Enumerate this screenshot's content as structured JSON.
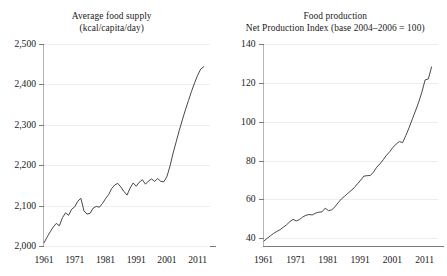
{
  "chart_data": [
    {
      "type": "line",
      "panel": "left",
      "title": "Average food supply",
      "subtitle": "(kcal/capita/day)",
      "xlabel": "",
      "ylabel": "",
      "xlim": [
        1961,
        2015
      ],
      "ylim": [
        2000,
        2500
      ],
      "yticks": [
        2000,
        2100,
        2200,
        2300,
        2400,
        2500
      ],
      "ytick_labels": [
        "2,000",
        "2,100",
        "2,200",
        "2,300",
        "2,400",
        "2,500"
      ],
      "xticks": [
        1961,
        1971,
        1981,
        1991,
        2001,
        2011
      ],
      "xtick_labels": [
        "1961",
        "1971",
        "1981",
        "1991",
        "2001",
        "2011"
      ],
      "grid": true,
      "legend": "none",
      "series": [
        {
          "name": "Average food supply",
          "x": [
            1961,
            1962,
            1963,
            1964,
            1965,
            1966,
            1967,
            1968,
            1969,
            1970,
            1971,
            1972,
            1973,
            1974,
            1975,
            1976,
            1977,
            1978,
            1979,
            1980,
            1981,
            1982,
            1983,
            1984,
            1985,
            1986,
            1987,
            1988,
            1989,
            1990,
            1991,
            1992,
            1993,
            1994,
            1995,
            1996,
            1997,
            1998,
            1999,
            2000,
            2001,
            2002,
            2003,
            2004,
            2005,
            2006,
            2007,
            2008,
            2009,
            2010,
            2011,
            2012,
            2013
          ],
          "values": [
            2008,
            2022,
            2035,
            2047,
            2056,
            2050,
            2070,
            2082,
            2076,
            2091,
            2097,
            2111,
            2118,
            2087,
            2079,
            2081,
            2094,
            2098,
            2096,
            2105,
            2117,
            2127,
            2142,
            2151,
            2155,
            2146,
            2135,
            2126,
            2143,
            2156,
            2148,
            2158,
            2164,
            2153,
            2161,
            2166,
            2160,
            2167,
            2160,
            2159,
            2172,
            2198,
            2230,
            2258,
            2286,
            2312,
            2337,
            2360,
            2383,
            2404,
            2423,
            2438,
            2444
          ]
        }
      ]
    },
    {
      "type": "line",
      "panel": "right",
      "title": "Food production",
      "subtitle": "Net Production Index (base 2004–2006 = 100)",
      "xlabel": "",
      "ylabel": "",
      "xlim": [
        1961,
        2015
      ],
      "ylim": [
        36,
        140
      ],
      "yticks": [
        40,
        60,
        80,
        100,
        120,
        140
      ],
      "ytick_labels": [
        "40",
        "60",
        "80",
        "100",
        "120",
        "140"
      ],
      "xticks": [
        1961,
        1971,
        1981,
        1991,
        2001,
        2011
      ],
      "xtick_labels": [
        "1961",
        "1971",
        "1981",
        "1991",
        "2001",
        "2011"
      ],
      "grid": true,
      "legend": "none",
      "series": [
        {
          "name": "Net Production Index",
          "x": [
            1961,
            1962,
            1963,
            1964,
            1965,
            1966,
            1967,
            1968,
            1969,
            1970,
            1971,
            1972,
            1973,
            1974,
            1975,
            1976,
            1977,
            1978,
            1979,
            1980,
            1981,
            1982,
            1983,
            1984,
            1985,
            1986,
            1987,
            1988,
            1989,
            1990,
            1991,
            1992,
            1993,
            1994,
            1995,
            1996,
            1997,
            1998,
            1999,
            2000,
            2001,
            2002,
            2003,
            2004,
            2005,
            2006,
            2007,
            2008,
            2009,
            2010,
            2011,
            2012,
            2013
          ],
          "values": [
            38.6,
            40.0,
            41.3,
            42.5,
            43.5,
            44.4,
            45.7,
            46.9,
            48.5,
            49.7,
            48.9,
            49.6,
            50.9,
            51.8,
            52.2,
            52.0,
            52.9,
            53.4,
            53.6,
            55.5,
            54.2,
            54.6,
            56.1,
            58.3,
            60.2,
            61.6,
            63.1,
            64.5,
            66.0,
            68.0,
            69.9,
            72.0,
            72.2,
            72.3,
            74.1,
            76.6,
            78.3,
            80.4,
            82.7,
            84.5,
            86.8,
            88.4,
            89.8,
            89.2,
            92.8,
            96.8,
            101.2,
            105.5,
            110.0,
            115.2,
            121.5,
            122.0,
            128.2,
            131.0,
            133.0
          ]
        }
      ]
    }
  ]
}
